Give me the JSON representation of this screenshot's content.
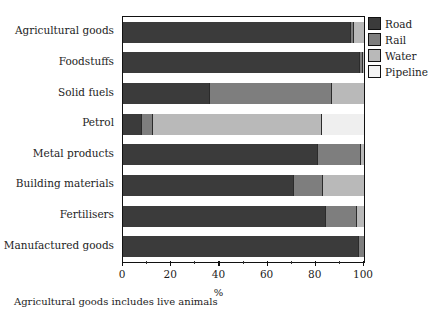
{
  "chart_data": {
    "type": "bar",
    "orientation": "horizontal",
    "stacked": true,
    "title": "",
    "xlabel": "%",
    "ylabel": "",
    "xlim": [
      0,
      100
    ],
    "xticks": [
      0,
      20,
      40,
      60,
      80,
      100
    ],
    "xtick_labels": [
      "0",
      "20",
      "40",
      "60",
      "80",
      "100"
    ],
    "xminor_ticks": [
      10,
      30,
      50,
      70,
      90
    ],
    "grid": false,
    "legend_position": "right-top",
    "categories": [
      "Agricultural goods",
      "Foodstuffs",
      "Solid fuels",
      "Petrol",
      "Metal products",
      "Building materials",
      "Fertilisers",
      "Manufactured goods"
    ],
    "series": [
      {
        "name": "Road",
        "color": "#3b3b3b",
        "values": [
          94,
          98,
          35.5,
          7.5,
          80.5,
          70.5,
          84,
          97.5
        ]
      },
      {
        "name": "Rail",
        "color": "#7e7e7e",
        "values": [
          1.5,
          1,
          51,
          4.5,
          18,
          12,
          12.5,
          2.5
        ]
      },
      {
        "name": "Water",
        "color": "#b9b9b9",
        "values": [
          4.5,
          1,
          13.5,
          70,
          1.5,
          17.5,
          3.5,
          0
        ]
      },
      {
        "name": "Pipeline",
        "color": "#efefef",
        "values": [
          0,
          0,
          0,
          18,
          0,
          0,
          0,
          0
        ]
      }
    ],
    "annotations": [
      "Agricultural goods includes live animals"
    ]
  },
  "legend": {
    "items": [
      {
        "label": "Road",
        "swatch": "road"
      },
      {
        "label": "Rail",
        "swatch": "rail"
      },
      {
        "label": "Water",
        "swatch": "water"
      },
      {
        "label": "Pipeline",
        "swatch": "pipeline"
      }
    ]
  },
  "footnote": "Agricultural goods includes live animals"
}
